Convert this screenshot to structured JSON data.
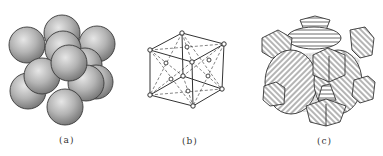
{
  "figure": {
    "panels": [
      {
        "id": "a",
        "label": "(a)",
        "description": "Hard-sphere model of face-centered cubic unit cell"
      },
      {
        "id": "b",
        "label": "(b)",
        "description": "Lattice point model of face-centered cubic unit cell"
      },
      {
        "id": "c",
        "label": "(c)",
        "description": "Sectioned atoms within face-centered cubic unit cell"
      }
    ]
  },
  "colors": {
    "sphere_fill_light": "#d8d8d8",
    "sphere_fill_dark": "#8a8a8a",
    "stroke": "#333333",
    "background": "#ffffff"
  }
}
